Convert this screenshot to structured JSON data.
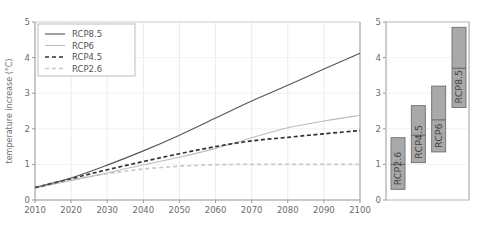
{
  "chart_data": [
    {
      "id": "left-panel",
      "type": "line",
      "title": "",
      "xlabel": "",
      "ylabel": "temperature increase (°C)",
      "xlim": [
        2010,
        2100
      ],
      "ylim": [
        0,
        5
      ],
      "xticks": [
        2010,
        2020,
        2030,
        2040,
        2050,
        2060,
        2070,
        2080,
        2090,
        2100
      ],
      "yticks": [
        0,
        1,
        2,
        3,
        4,
        5
      ],
      "grid": true,
      "legend_position": "upper-left",
      "x": [
        2010,
        2020,
        2030,
        2040,
        2050,
        2060,
        2070,
        2080,
        2090,
        2100
      ],
      "series": [
        {
          "name": "RCP8.5",
          "color": "#555555",
          "style": "solid",
          "values": [
            0.35,
            0.62,
            0.98,
            1.38,
            1.82,
            2.3,
            2.78,
            3.22,
            3.68,
            4.12
          ]
        },
        {
          "name": "RCP6",
          "color": "#bcbcbc",
          "style": "solid",
          "values": [
            0.33,
            0.55,
            0.76,
            0.99,
            1.2,
            1.45,
            1.75,
            2.03,
            2.22,
            2.38
          ]
        },
        {
          "name": "RCP4.5",
          "color": "#333333",
          "style": "dashed",
          "values": [
            0.35,
            0.6,
            0.85,
            1.08,
            1.3,
            1.5,
            1.66,
            1.76,
            1.86,
            1.95
          ]
        },
        {
          "name": "RCP2.6",
          "color": "#c9c9c9",
          "style": "dashed",
          "values": [
            0.34,
            0.56,
            0.74,
            0.87,
            0.95,
            0.99,
            1.0,
            1.0,
            1.0,
            1.0
          ]
        }
      ]
    },
    {
      "id": "right-panel",
      "type": "bar",
      "title": "",
      "xlabel": "",
      "ylabel": "",
      "ylim": [
        0,
        5
      ],
      "yticks": [
        0,
        1,
        2,
        3,
        4,
        5
      ],
      "grid": true,
      "note": "range bars with median line",
      "categories": [
        "RCP2.6",
        "RCP4.5",
        "RCP6",
        "RCP8.5"
      ],
      "bars": [
        {
          "name": "RCP2.6",
          "low": 0.3,
          "high": 1.75,
          "median": 1.0
        },
        {
          "name": "RCP4.5",
          "low": 1.05,
          "high": 2.65,
          "median": 1.82
        },
        {
          "name": "RCP6",
          "low": 1.35,
          "high": 3.2,
          "median": 2.25
        },
        {
          "name": "RCP8.5",
          "low": 2.6,
          "high": 4.85,
          "median": 3.7
        }
      ],
      "bar_fill": "#a9a9a9",
      "bar_stroke": "#6e6e6e"
    }
  ],
  "legend": {
    "items": [
      {
        "label": "RCP8.5"
      },
      {
        "label": "RCP6"
      },
      {
        "label": "RCP4.5"
      },
      {
        "label": "RCP2.6"
      }
    ]
  },
  "axes": {
    "y_label_left": "temperature increase (°C)",
    "left_yticks": [
      "5",
      "4",
      "3",
      "2",
      "1",
      "0"
    ],
    "left_xticks": [
      "2010",
      "2020",
      "2030",
      "2040",
      "2050",
      "2060",
      "2070",
      "2080",
      "2090",
      "2100"
    ],
    "right_yticks": [
      "5",
      "4",
      "3",
      "2",
      "1",
      "0"
    ]
  }
}
